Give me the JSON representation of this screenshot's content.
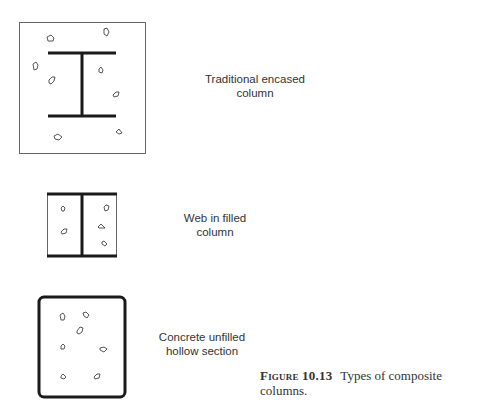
{
  "figure": {
    "number": "Figure 10.13",
    "caption": "Types of composite columns."
  },
  "sections": [
    {
      "id": "traditional-encased",
      "label_line1": "Traditional encased",
      "label_line2": "column"
    },
    {
      "id": "web-in-filled",
      "label_line1": "Web in filled",
      "label_line2": "column"
    },
    {
      "id": "concrete-unfilled-hollow",
      "label_line1": "Concrete unfilled",
      "label_line2": "hollow section"
    }
  ],
  "colors": {
    "steel_line": "#1a1a1a",
    "outline": "#555555",
    "aggregate": "#444444"
  }
}
